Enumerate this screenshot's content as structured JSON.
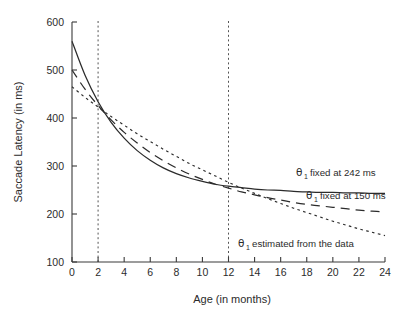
{
  "chart_data": {
    "type": "line",
    "title": "",
    "xlabel": "Age (in months)",
    "ylabel": "Saccade Latency (in ms)",
    "xlim": [
      0,
      24
    ],
    "ylim": [
      100,
      600
    ],
    "xticks": [
      0,
      2,
      4,
      6,
      8,
      10,
      12,
      14,
      16,
      18,
      20,
      22,
      24
    ],
    "yticks": [
      100,
      200,
      300,
      400,
      500,
      600
    ],
    "grid": false,
    "legend_position": "inline-annotations",
    "reference_lines": [
      {
        "axis": "x",
        "value": 2,
        "style": "dotted"
      },
      {
        "axis": "x",
        "value": 12,
        "style": "dotted"
      }
    ],
    "x": [
      0,
      1,
      2,
      3,
      4,
      5,
      6,
      7,
      8,
      9,
      10,
      11,
      12,
      13,
      14,
      15,
      16,
      17,
      18,
      19,
      20,
      21,
      22,
      23,
      24
    ],
    "series": [
      {
        "name": "theta1-fixed-242",
        "label": "fixed at 242 ms",
        "style": "solid",
        "asymptote": 242,
        "values": [
          560,
          489,
          434,
          391,
          358,
          332,
          312,
          296,
          284,
          275,
          268,
          262,
          258,
          255,
          252,
          250,
          249,
          247,
          246,
          245,
          245,
          244,
          244,
          243,
          243
        ]
      },
      {
        "name": "theta1-fixed-150",
        "label": "fixed at 150 ms",
        "style": "dashed",
        "asymptote": 150,
        "values": [
          500,
          460,
          426,
          396,
          370,
          348,
          328,
          311,
          296,
          283,
          272,
          262,
          254,
          246,
          240,
          234,
          229,
          224,
          220,
          217,
          214,
          211,
          208,
          206,
          204
        ]
      },
      {
        "name": "theta1-estimated",
        "label": "estimated from the data",
        "style": "dotted",
        "asymptote": 0,
        "values": [
          465,
          443,
          423,
          403,
          385,
          367,
          351,
          335,
          320,
          305,
          292,
          279,
          266,
          254,
          243,
          232,
          222,
          212,
          203,
          194,
          185,
          177,
          169,
          162,
          155
        ]
      }
    ],
    "annotations": [
      {
        "name": "annot-fixed-242",
        "theta": "θ",
        "sub": "1",
        "text": "fixed at 242 ms"
      },
      {
        "name": "annot-fixed-150",
        "theta": "θ",
        "sub": "1",
        "text": "fixed at 150 ms"
      },
      {
        "name": "annot-estimated",
        "theta": "θ",
        "sub": "1",
        "text": "estimated from the data"
      }
    ],
    "colors": {
      "axis": "#3a3a3a",
      "curve": "#2b2b2b",
      "reference": "#555555",
      "background": "#ffffff"
    }
  }
}
